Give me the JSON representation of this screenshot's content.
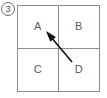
{
  "figure": {
    "index_marker": {
      "icon": "circled-number-marker",
      "label": "3"
    },
    "grid": {
      "rows": 2,
      "columns": 2,
      "border_color": "#8d8d8d",
      "background_color": "#ffffff",
      "cells": [
        {
          "id": "top-left",
          "label": "A"
        },
        {
          "id": "top-right",
          "label": "B"
        },
        {
          "id": "bottom-left",
          "label": "C"
        },
        {
          "id": "bottom-right",
          "label": "D"
        }
      ]
    },
    "annotation": {
      "icon": "arrow-icon",
      "type": "arrow",
      "color": "#111111",
      "direction": "up-left",
      "from_cell": "D",
      "to_cell": "A",
      "tail_x": 72,
      "tail_y": 62,
      "tip_x": 46,
      "tip_y": 31
    }
  }
}
